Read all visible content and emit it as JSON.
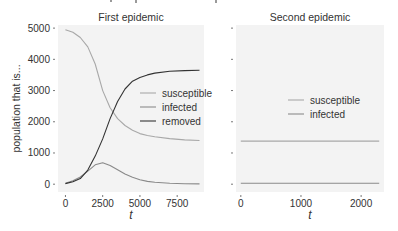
{
  "figure": {
    "background": "#ffffff",
    "panel_background": "#f3f3f3",
    "colors": {
      "susceptible": "#a8a8a8",
      "infected": "#8a8a8a",
      "removed": "#333333",
      "text": "#333333",
      "tick": "#555555"
    }
  },
  "chart_data": [
    {
      "type": "line",
      "title": "First epidemic",
      "xlabel": "t",
      "ylabel": "population that is...",
      "xlim": [
        -500,
        9300
      ],
      "ylim": [
        -250,
        5100
      ],
      "xticks": [
        0,
        2500,
        5000,
        7500
      ],
      "xtick_labels": [
        "0",
        "2500",
        "5000",
        "7500"
      ],
      "yticks": [
        0,
        1000,
        2000,
        3000,
        4000,
        5000
      ],
      "ytick_labels": [
        "0",
        "1000",
        "2000",
        "3000",
        "4000",
        "5000"
      ],
      "grid": false,
      "legend": {
        "position": "center-right",
        "entries": [
          "susceptible",
          "infected",
          "removed"
        ]
      },
      "x": [
        0,
        500,
        1000,
        1500,
        2000,
        2500,
        3000,
        3500,
        4000,
        4500,
        5000,
        5500,
        6000,
        7000,
        8000,
        9000
      ],
      "series": [
        {
          "name": "susceptible",
          "values": [
            4950,
            4870,
            4700,
            4400,
            3850,
            3000,
            2450,
            2100,
            1880,
            1730,
            1620,
            1560,
            1520,
            1460,
            1420,
            1400
          ]
        },
        {
          "name": "infected",
          "values": [
            30,
            110,
            230,
            420,
            620,
            690,
            600,
            460,
            330,
            220,
            140,
            90,
            60,
            30,
            15,
            10
          ]
        },
        {
          "name": "removed",
          "values": [
            20,
            80,
            180,
            450,
            900,
            1450,
            2100,
            2650,
            3050,
            3300,
            3420,
            3500,
            3560,
            3620,
            3640,
            3650
          ]
        }
      ]
    },
    {
      "type": "line",
      "title": "Second epidemic",
      "xlabel": "t",
      "ylabel": "",
      "xlim": [
        -80,
        2380
      ],
      "ylim": [
        -250,
        5100
      ],
      "xticks": [
        0,
        1000,
        2000
      ],
      "xtick_labels": [
        "0",
        "1000",
        "2000"
      ],
      "yticks": [
        0,
        1000,
        2000,
        3000,
        4000,
        5000
      ],
      "ytick_labels": [
        "",
        "",
        "",
        "",
        "",
        ""
      ],
      "grid": false,
      "legend": {
        "position": "center-right",
        "entries": [
          "susceptible",
          "infected"
        ]
      },
      "x": [
        0,
        500,
        1000,
        1500,
        2000,
        2300
      ],
      "series": [
        {
          "name": "susceptible",
          "values": [
            1380,
            1380,
            1380,
            1380,
            1380,
            1380
          ]
        },
        {
          "name": "infected",
          "values": [
            30,
            30,
            30,
            30,
            30,
            30
          ]
        }
      ]
    }
  ]
}
